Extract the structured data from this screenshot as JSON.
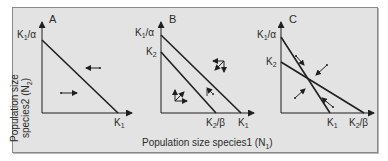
{
  "figure": {
    "x_axis_label": "Population size species1 (N",
    "x_axis_label_sub": "1",
    "x_axis_label_end": ")",
    "y_axis_label_line1": "Population size",
    "y_axis_label_line2": "species2 (N",
    "y_axis_label_sub": "2",
    "y_axis_label_end": ")",
    "colors": {
      "background": "#e3e3e3",
      "line": "#1f1f1f",
      "text": "#2b2b2b"
    }
  },
  "panels": [
    {
      "letter": "A",
      "y_ticks": [
        {
          "main": "K",
          "sub": "1",
          "suffix": "/α"
        }
      ],
      "x_ticks": [
        {
          "main": "K",
          "sub": "1",
          "suffix": ""
        }
      ],
      "description": "Single isocline for species 1; arrows point toward the line"
    },
    {
      "letter": "B",
      "y_ticks": [
        {
          "main": "K",
          "sub": "1",
          "suffix": "/α"
        },
        {
          "main": "K",
          "sub": "2",
          "suffix": ""
        }
      ],
      "x_ticks": [
        {
          "main": "K",
          "sub": "2",
          "suffix": "/β"
        },
        {
          "main": "K",
          "sub": "1",
          "suffix": ""
        }
      ],
      "description": "Parallel isoclines; species 1 isocline above species 2"
    },
    {
      "letter": "C",
      "y_ticks": [
        {
          "main": "K",
          "sub": "1",
          "suffix": "/α"
        },
        {
          "main": "K",
          "sub": "2",
          "suffix": ""
        }
      ],
      "x_ticks": [
        {
          "main": "K",
          "sub": "1",
          "suffix": ""
        },
        {
          "main": "K",
          "sub": "2",
          "suffix": "/β"
        }
      ],
      "description": "Crossing isoclines with stable equilibrium; arrows converge on intersection"
    }
  ]
}
